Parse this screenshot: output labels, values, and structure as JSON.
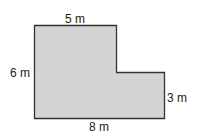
{
  "diagram": {
    "shape": "L-shaped polygon",
    "fill_color": "#d4d4d4",
    "stroke_color": "#333333",
    "labels": {
      "top": "5 m",
      "left": "6 m",
      "right": "3 m",
      "bottom": "8 m"
    }
  }
}
